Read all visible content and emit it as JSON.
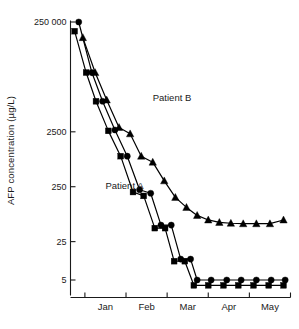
{
  "chart_data": {
    "type": "line",
    "title": "",
    "xlabel": "",
    "ylabel": "AFP concentration (µg/L)",
    "yscale": "log",
    "ylim": [
      3.2,
      400000
    ],
    "ytick_values": [
      250000,
      2500,
      250,
      25,
      5
    ],
    "ytick_labels": [
      "250 000",
      "2500",
      "250",
      "25",
      "5"
    ],
    "xlim": [
      0,
      5.35
    ],
    "x_boundary_ticks": [
      0.35,
      1.35,
      2.35,
      3.35,
      4.35,
      5.35
    ],
    "categories": [
      "Jan",
      "Feb",
      "Mar",
      "Apr",
      "May"
    ],
    "xtick_labels": [
      "Jan",
      "Feb",
      "Mar",
      "Apr",
      "May"
    ],
    "grid": false,
    "legend": "inline-annotations",
    "annotations": [
      {
        "text": "Patient B",
        "x": 2.0,
        "y": 9000
      },
      {
        "text": "Patient A",
        "x": 0.85,
        "y": 230
      }
    ],
    "series": [
      {
        "name": "Patient A",
        "marker": "square",
        "color": "#000000",
        "x": [
          0.1,
          0.38,
          0.62,
          0.92,
          1.22,
          1.52,
          1.78,
          2.05,
          2.3,
          2.52,
          2.78,
          3.0,
          3.35,
          3.72,
          4.08,
          4.45,
          4.82,
          5.18
        ],
        "y": [
          170000,
          30000,
          9000,
          2600,
          900,
          200,
          170,
          44,
          44,
          11,
          11,
          4.0,
          4.0,
          4.0,
          4.0,
          4.0,
          4.0,
          4.0
        ]
      },
      {
        "name": "Unlabelled circle series",
        "marker": "circle",
        "color": "#000000",
        "x": [
          0.2,
          0.52,
          0.78,
          1.08,
          1.38,
          1.68,
          1.95,
          2.2,
          2.45,
          2.68,
          2.92,
          3.08,
          3.42,
          3.8,
          4.15,
          4.52,
          4.88,
          5.22
        ],
        "y": [
          250000,
          30000,
          9000,
          2700,
          900,
          220,
          190,
          50,
          50,
          12,
          12,
          5.0,
          5.0,
          5.0,
          5.0,
          5.0,
          5.0,
          5.0
        ]
      },
      {
        "name": "Patient B",
        "marker": "triangle",
        "color": "#000000",
        "x": [
          0.3,
          0.6,
          0.88,
          1.18,
          1.45,
          1.72,
          2.0,
          2.28,
          2.55,
          2.82,
          3.08,
          3.35,
          3.62,
          3.9,
          4.2,
          4.52,
          4.85,
          5.18
        ],
        "y": [
          130000,
          30000,
          9500,
          3000,
          2300,
          900,
          700,
          320,
          160,
          105,
          75,
          62,
          56,
          54,
          53,
          53,
          53,
          62
        ]
      }
    ]
  }
}
